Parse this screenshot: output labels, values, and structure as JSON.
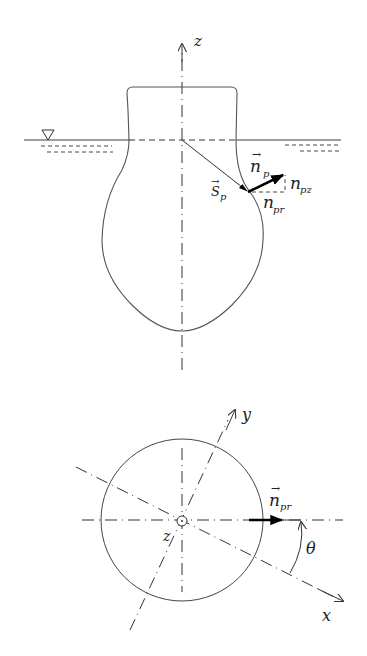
{
  "side_view": {
    "axis_label": "z",
    "water_symbol": "∇",
    "position_vector": {
      "arrow": "→",
      "base": "S",
      "sub": "p"
    },
    "normal_vector": {
      "arrow": "→",
      "base": "n",
      "sub": "p"
    },
    "normal_z_component": {
      "base": "n",
      "sub": "pz"
    },
    "normal_r_component": {
      "base": "n",
      "sub": "pr"
    }
  },
  "top_view": {
    "x_axis_label": "x",
    "y_axis_label": "y",
    "z_axis_label": "z",
    "radial_normal": {
      "arrow": "→",
      "base": "n",
      "sub": "pr"
    },
    "angle_label": "θ"
  },
  "colors": {
    "line": "#3a3a3a",
    "bold_vector": "#000000",
    "background": "#ffffff"
  }
}
